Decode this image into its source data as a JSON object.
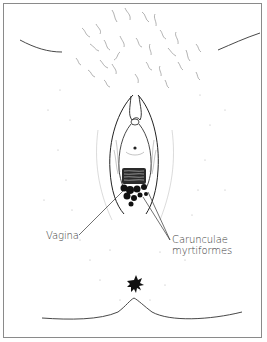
{
  "figure": {
    "type": "anatomical line illustration",
    "border_color": "#8a8a8a",
    "ink_color": "#1a1a1a",
    "label_color": "#3a3a3a"
  },
  "labels": {
    "vagina": "Vagina",
    "caruncle_line1": "Carunculae",
    "caruncle_line2": "myrtiformes"
  }
}
